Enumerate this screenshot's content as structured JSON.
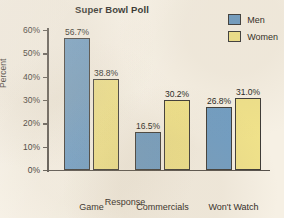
{
  "chart_data": {
    "type": "bar",
    "title": "Super Bowl Poll",
    "xlabel": "Response",
    "ylabel": "Percent",
    "categories": [
      "Game",
      "Commercials",
      "Won't Watch"
    ],
    "series": [
      {
        "name": "Men",
        "color": "#6f9dc4",
        "values": [
          56.7,
          16.5,
          26.8
        ],
        "labels": [
          "56.7%",
          "16.5%",
          "26.8%"
        ]
      },
      {
        "name": "Women",
        "color": "#f0e28a",
        "values": [
          38.8,
          30.2,
          31.0
        ],
        "labels": [
          "38.8%",
          "30.2%",
          "31.0%"
        ]
      }
    ],
    "ylim": [
      0,
      60
    ],
    "yticks": [
      0,
      10,
      20,
      30,
      40,
      50,
      60
    ],
    "ytick_labels": [
      "0%",
      "10%",
      "20%",
      "30%",
      "40%",
      "50%",
      "60%"
    ],
    "grid": false,
    "legend_position": "top-right",
    "background_color": "#f6f0e4",
    "axis_color": "#55504a",
    "text_color": "#2a2520"
  },
  "legend": {
    "men_label": "Men",
    "women_label": "Women"
  }
}
